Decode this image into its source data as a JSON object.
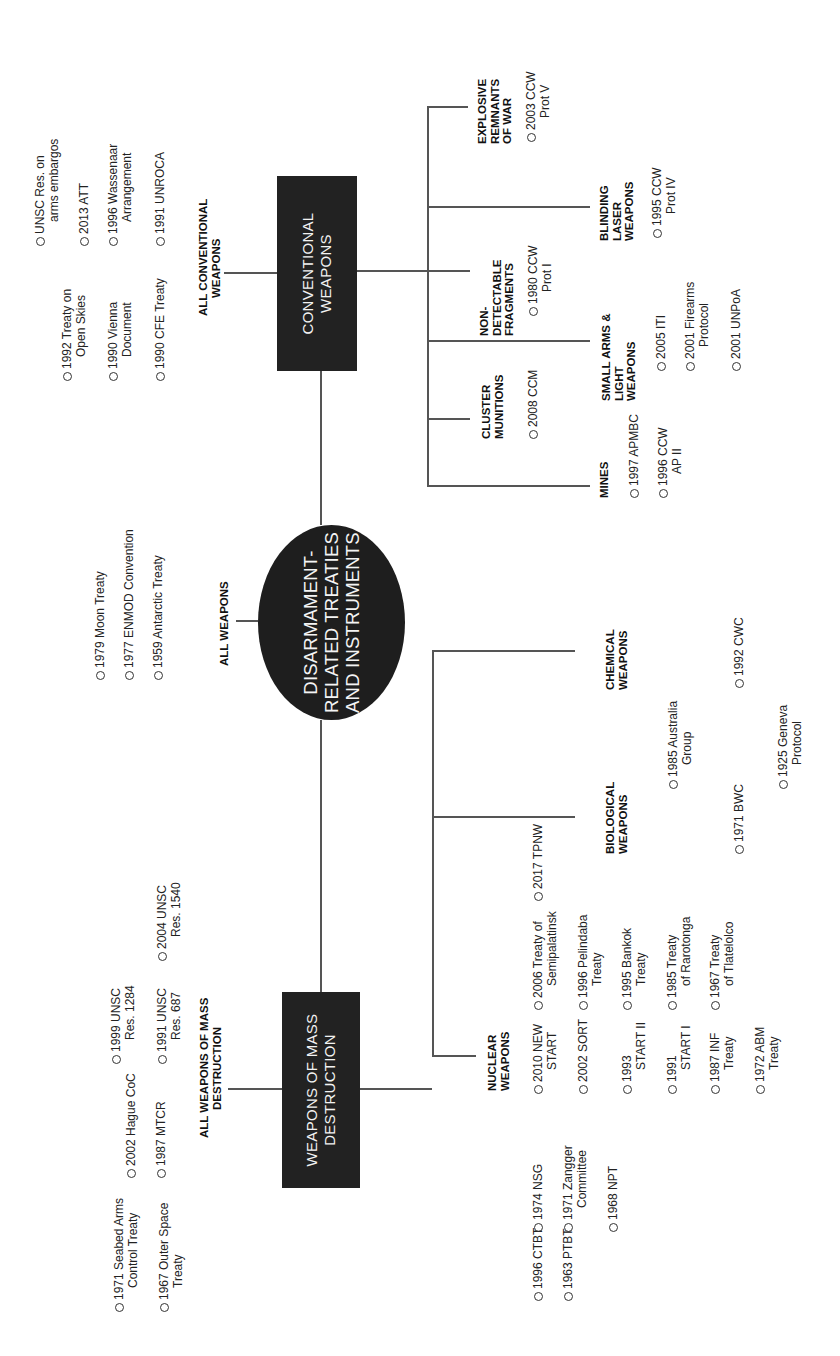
{
  "root": {
    "label_lines": [
      "DISARMAMENT-",
      "RELATED TREATIES",
      "AND INSTRUMENTS"
    ]
  },
  "all_weapons": {
    "label": "ALL WEAPONS",
    "items": [
      {
        "l1": "1979 Moon Treaty"
      },
      {
        "l1": "1977 ENMOD Convention"
      },
      {
        "l1": "1959 Antarctic Treaty"
      }
    ]
  },
  "wmd": {
    "box_lines": [
      "WEAPONS OF MASS",
      "DESTRUCTION"
    ],
    "all_label_lines": [
      "ALL WEAPONS OF MASS",
      "DESTRUCTION"
    ],
    "all_items": [
      {
        "l1": "1971 Seabed Arms",
        "l2": "Control Treaty"
      },
      {
        "l1": "1967 Outer Space",
        "l2": "Treaty"
      },
      {
        "l1": "2002 Hague CoC"
      },
      {
        "l1": "1987 MTCR"
      },
      {
        "l1": "1999 UNSC",
        "l2": "Res. 1284"
      },
      {
        "l1": "1991 UNSC",
        "l2": "Res. 687"
      },
      {
        "l1": "2004 UNSC",
        "l2": "Res. 1540"
      }
    ],
    "nuclear": {
      "label_lines": [
        "NUCLEAR",
        "WEAPONS"
      ],
      "items": [
        {
          "l1": "1996 CTBT"
        },
        {
          "l1": "1963 PTBT"
        },
        {
          "l1": "1974 NSG"
        },
        {
          "l1": "1971 Zangger",
          "l2": "Committee"
        },
        {
          "l1": "1968 NPT"
        },
        {
          "l1": "2010 NEW",
          "l2": "START"
        },
        {
          "l1": "2002 SORT"
        },
        {
          "l1": "1993",
          "l2": "START II"
        },
        {
          "l1": "1991",
          "l2": "START I"
        },
        {
          "l1": "1987 INF",
          "l2": "Treaty"
        },
        {
          "l1": "1972 ABM",
          "l2": "Treaty"
        },
        {
          "l1": "2006 Treaty of",
          "l2": "Semipalatinsk"
        },
        {
          "l1": "1996 Pelindaba",
          "l2": "Treaty"
        },
        {
          "l1": "1995 Bankok",
          "l2": "Treaty"
        },
        {
          "l1": "1985 Treaty",
          "l2": "of Rarotonga"
        },
        {
          "l1": "1967 Treaty",
          "l2": "of Tlatelolco"
        },
        {
          "l1": "2017 TPNW"
        }
      ]
    },
    "biological": {
      "label_lines": [
        "BIOLOGICAL",
        "WEAPONS"
      ],
      "items": [
        {
          "l1": "1971 BWC"
        }
      ]
    },
    "chemical": {
      "label_lines": [
        "CHEMICAL",
        "WEAPONS"
      ],
      "items": [
        {
          "l1": "1992 CWC"
        }
      ]
    },
    "shared_bio_chem": [
      {
        "l1": "1985 Australia",
        "l2": "Group"
      },
      {
        "l1": "1925 Geneva",
        "l2": "Protocol"
      }
    ]
  },
  "conventional": {
    "box_lines": [
      "CONVENTIONAL",
      "WEAPONS"
    ],
    "all_label_lines": [
      "ALL CONVENTIONAL",
      "WEAPONS"
    ],
    "all_items": [
      {
        "l1": "1992 Treaty on",
        "l2": "Open Skies"
      },
      {
        "l1": "1990 Vienna",
        "l2": "Document"
      },
      {
        "l1": "1990 CFE Treaty"
      },
      {
        "l1": "UNSC Res. on",
        "l2": "arms embargos"
      },
      {
        "l1": "2013 ATT"
      },
      {
        "l1": "1996 Wassenaar",
        "l2": "Arrangement"
      },
      {
        "l1": "1991 UNROCA"
      }
    ],
    "mines": {
      "label_lines": [
        "MINES"
      ],
      "items": [
        {
          "l1": "1997 APMBC"
        },
        {
          "l1": "1996 CCW",
          "l2": "AP II"
        }
      ]
    },
    "cluster": {
      "label_lines": [
        "CLUSTER",
        "MUNITIONS"
      ],
      "items": [
        {
          "l1": "2008 CCM"
        }
      ]
    },
    "salw": {
      "label_lines": [
        "SMALL ARMS &",
        "LIGHT",
        "WEAPONS"
      ],
      "items": [
        {
          "l1": "2005 ITI"
        },
        {
          "l1": "2001 Firearms",
          "l2": "Protocol"
        },
        {
          "l1": "2001 UNPoA"
        }
      ]
    },
    "ndf": {
      "label_lines": [
        "NON-",
        "DETECTABLE",
        "FRAGMENTS"
      ],
      "items": [
        {
          "l1": "1980 CCW",
          "l2": "Prot I"
        }
      ]
    },
    "blinding": {
      "label_lines": [
        "BLINDING",
        "LASER",
        "WEAPONS"
      ],
      "items": [
        {
          "l1": "1995 CCW",
          "l2": "Prot IV"
        }
      ]
    },
    "erw": {
      "label_lines": [
        "EXPLOSIVE",
        "REMNANTS",
        "OF WAR"
      ],
      "items": [
        {
          "l1": "2003 CCW",
          "l2": "Prot V"
        }
      ]
    }
  },
  "colors": {
    "box_fill": "#222222",
    "box_text": "#f2f2f2",
    "line": "#555555",
    "text": "#222222"
  }
}
